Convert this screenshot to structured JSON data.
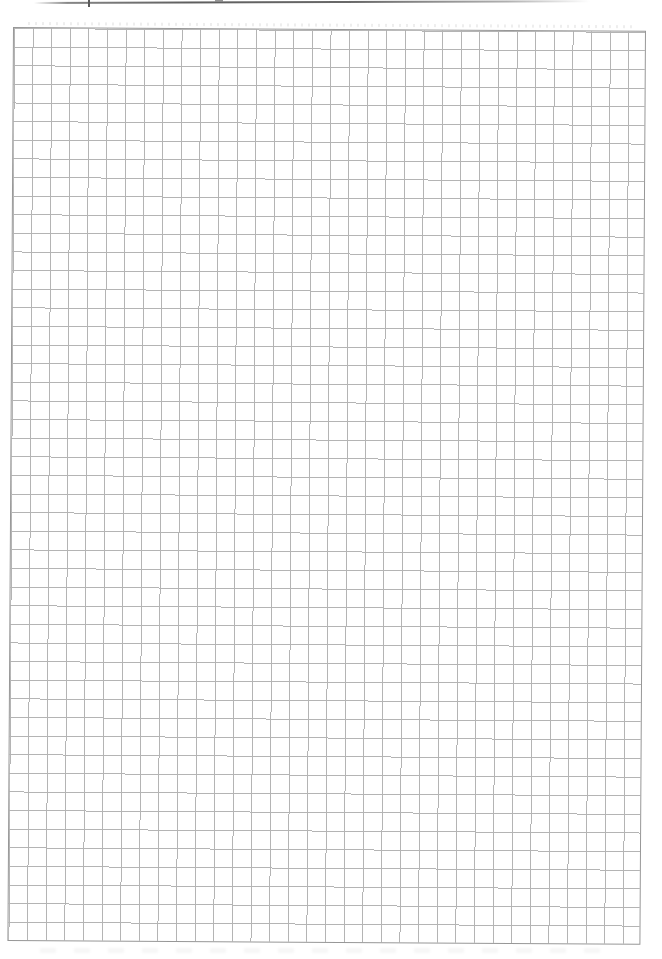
{
  "page": {
    "type": "scanned-blank-graph-paper-sheet",
    "visible_text": ""
  },
  "header": {
    "rule": "underline of cropped-off header text",
    "remnants": [
      {
        "label": "letter-descender-mark"
      },
      {
        "label": "letter-descender-mark"
      }
    ]
  },
  "grid": {
    "columns": 34,
    "rows": 49,
    "cell_size_px": 18.62,
    "content": "empty"
  },
  "theme": {
    "paper": "#ffffff",
    "rule-color": "#5e5e5e",
    "grid-line": "#b4b4b4",
    "grid-border": "#979797",
    "cell": "18.62px",
    "grid-rotation": "0.35deg"
  }
}
